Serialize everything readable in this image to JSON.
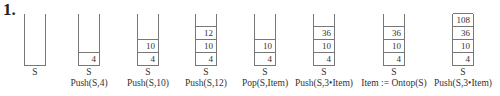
{
  "problem_number": "1.",
  "stacks": [
    {
      "x": 24,
      "name": "S",
      "caption": "",
      "items": []
    },
    {
      "x": 78,
      "name": "S",
      "caption": "Push(S,4)",
      "items": [
        "4"
      ]
    },
    {
      "x": 137,
      "name": "S",
      "caption": "Push(S,10)",
      "items": [
        "4",
        "10"
      ]
    },
    {
      "x": 195,
      "name": "S",
      "caption": "Push(S,12)",
      "items": [
        "4",
        "10",
        "12"
      ]
    },
    {
      "x": 254,
      "name": "S",
      "caption": "Pop(S,Item)",
      "items": [
        "4",
        "10"
      ]
    },
    {
      "x": 313,
      "name": "S",
      "caption": "Push(S,3•Item)",
      "items": [
        "4",
        "10",
        "36"
      ]
    },
    {
      "x": 383,
      "name": "S",
      "caption": "Item := Ontop(S)",
      "items": [
        "4",
        "10",
        "36"
      ]
    },
    {
      "x": 452,
      "name": "S",
      "caption": "Push(S,3•Item)",
      "items": [
        "4",
        "10",
        "36",
        "108"
      ]
    }
  ]
}
